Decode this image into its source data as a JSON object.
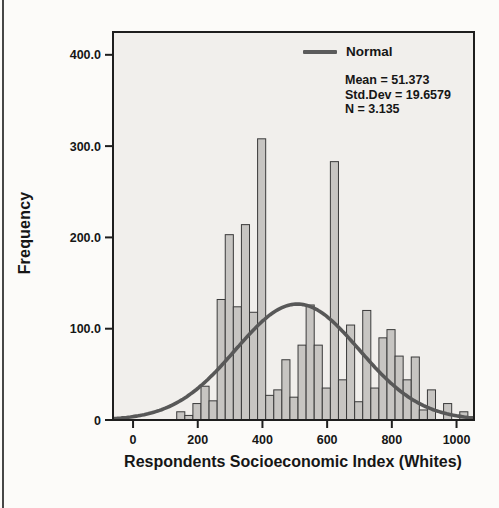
{
  "page": {
    "background": "#fcfbf9",
    "edge_line_color": "#474747"
  },
  "colors": {
    "plot_background": "#f1efec",
    "bar_fill": "#c7c5c2",
    "bar_stroke": "#3a3a3a",
    "curve": "#585858",
    "axis": "#1e1e1e",
    "text": "#161616"
  },
  "chart_data": {
    "type": "bar",
    "subtype": "histogram-with-normal-curve",
    "title": "",
    "xlabel": "Respondents Socioeconomic Index (Whites)",
    "ylabel": "Frequency",
    "legend_label": "Normal",
    "legend_position": "top-right-inside",
    "grid": false,
    "stats": {
      "mean": "Mean = 51.373",
      "std_dev": "Std.Dev = 19.6579",
      "n": "N = 3.135"
    },
    "xlim": [
      -62,
      1054
    ],
    "ylim": [
      0,
      425
    ],
    "x_ticks": [
      {
        "v": 0,
        "label": "0"
      },
      {
        "v": 200,
        "label": "200"
      },
      {
        "v": 400,
        "label": "400"
      },
      {
        "v": 600,
        "label": "600"
      },
      {
        "v": 800,
        "label": "800"
      },
      {
        "v": 1000,
        "label": "1000"
      }
    ],
    "y_ticks": [
      {
        "v": 400,
        "label": "400.0"
      },
      {
        "v": 300,
        "label": "300.0"
      },
      {
        "v": 200,
        "label": "200.0"
      },
      {
        "v": 100,
        "label": "100.0"
      },
      {
        "v": 0,
        "label": "0"
      }
    ],
    "bin_width": 25,
    "bin_starts": [
      135,
      160,
      185,
      210,
      235,
      260,
      285,
      310,
      335,
      360,
      385,
      410,
      435,
      460,
      485,
      510,
      535,
      560,
      585,
      610,
      635,
      660,
      685,
      710,
      735,
      760,
      785,
      810,
      835,
      860,
      885,
      910,
      935,
      960,
      985,
      1010
    ],
    "frequencies": [
      9,
      5,
      18,
      37,
      21,
      132,
      203,
      124,
      214,
      118,
      308,
      27,
      33,
      66,
      25,
      82,
      126,
      82,
      35,
      283,
      44,
      104,
      20,
      120,
      35,
      90,
      99,
      70,
      44,
      69,
      11,
      33,
      0,
      18,
      0,
      9
    ],
    "normal_curve": {
      "mean": 508,
      "sd": 191,
      "peak_frequency": 127
    }
  }
}
